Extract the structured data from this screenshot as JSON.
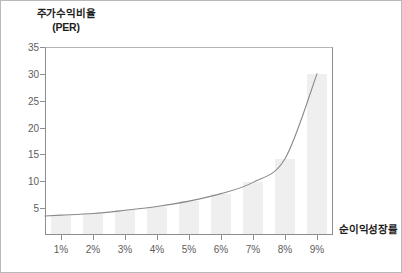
{
  "chart_data": {
    "type": "line",
    "title": "",
    "ylabel": "주가수익비율",
    "ylabel_unit": "(PER)",
    "xlabel": "순이익성장률",
    "categories": [
      "1%",
      "2%",
      "3%",
      "4%",
      "5%",
      "6%",
      "7%",
      "8%",
      "9%"
    ],
    "x": [
      1,
      2,
      3,
      4,
      5,
      6,
      7,
      8,
      9
    ],
    "values": [
      3.7,
      4.0,
      4.6,
      5.3,
      6.3,
      7.7,
      9.8,
      14.2,
      30.0
    ],
    "series": [
      {
        "name": "주가수익비율(PER)",
        "values": [
          3.7,
          4.0,
          4.6,
          5.3,
          6.3,
          7.7,
          9.8,
          14.2,
          30.0
        ]
      }
    ],
    "bar_values": [
      3.7,
      4.0,
      4.6,
      5.3,
      6.3,
      7.7,
      9.8,
      14.2,
      30.0
    ],
    "ylim": [
      0,
      35
    ],
    "xlim": [
      0.5,
      9.5
    ],
    "yticks": [
      5,
      10,
      15,
      20,
      25,
      30,
      35
    ],
    "ytick_labels": [
      "5",
      "10",
      "15",
      "20",
      "25",
      "30",
      "35"
    ],
    "xtick_labels": [
      "1%",
      "2%",
      "3%",
      "4%",
      "5%",
      "6%",
      "7%",
      "8%",
      "9%"
    ],
    "grid": false,
    "legend": "none",
    "line_color": "#8a8a8a",
    "bar_color": "#efefef",
    "axis_color": "#8e8e8e",
    "text_color": "#5d5d5d",
    "title_color": "#1d1d1d"
  }
}
